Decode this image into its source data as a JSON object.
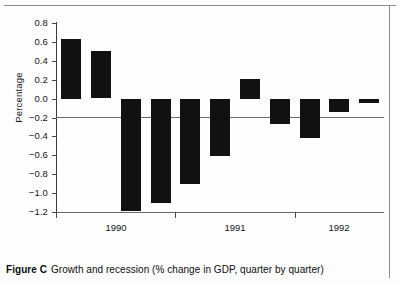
{
  "figure": {
    "caption_label": "Figure C",
    "caption_text": "Growth and recession (% change in GDP, quarter by quarter)"
  },
  "chart_data": {
    "type": "bar",
    "title": "Growth and recession (% change in GDP, quarter by quarter)",
    "xlabel": "",
    "ylabel": "Percentage",
    "ylim": [
      -1.2,
      0.8
    ],
    "yticks": [
      0.8,
      0.6,
      0.4,
      0.2,
      0.0,
      -0.2,
      -0.4,
      -0.6,
      -0.8,
      -1.0,
      -1.2
    ],
    "ytick_labels": [
      "0.8",
      "0.6",
      "0.4",
      "0.2",
      "0.0",
      "−0.2",
      "−0.4",
      "−0.6",
      "−0.8",
      "−1.0",
      "−1.2"
    ],
    "xtick_labels": [
      "1990",
      "1991",
      "1992"
    ],
    "grid": false,
    "legend": null,
    "bar_color": "#111111",
    "categories": [
      "1990 Q1",
      "1990 Q2",
      "1990 Q3",
      "1990 Q4",
      "1991 Q1",
      "1991 Q2",
      "1991 Q3",
      "1991 Q4",
      "1992 Q1",
      "1992 Q2",
      "1992 Q3"
    ],
    "values": [
      0.63,
      0.5,
      -1.18,
      -1.1,
      -0.9,
      -0.6,
      0.21,
      -0.26,
      -0.41,
      -0.14,
      -0.04
    ]
  }
}
